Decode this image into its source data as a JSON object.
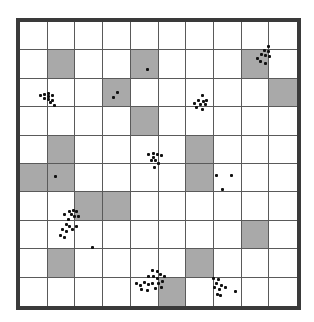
{
  "grid": {
    "rows": 10,
    "cols": 10,
    "shaded_color": "#a9a9a9",
    "border_color": "#3a3a3a",
    "line_color": "#5a5a5a",
    "shaded_cells": [
      [
        1,
        1
      ],
      [
        1,
        4
      ],
      [
        1,
        8
      ],
      [
        2,
        3
      ],
      [
        2,
        9
      ],
      [
        3,
        4
      ],
      [
        4,
        1
      ],
      [
        4,
        6
      ],
      [
        5,
        0
      ],
      [
        5,
        1
      ],
      [
        5,
        6
      ],
      [
        6,
        2
      ],
      [
        6,
        3
      ],
      [
        7,
        8
      ],
      [
        8,
        1
      ],
      [
        8,
        6
      ],
      [
        9,
        5
      ]
    ]
  },
  "dot_clusters": [
    {
      "name": "cluster-top-right",
      "points": [
        [
          268,
          46
        ],
        [
          264,
          50
        ],
        [
          268,
          51
        ],
        [
          261,
          54
        ],
        [
          265,
          55
        ],
        [
          269,
          56
        ],
        [
          257,
          58
        ],
        [
          260,
          61
        ],
        [
          265,
          63
        ]
      ]
    },
    {
      "name": "cluster-left-row2",
      "points": [
        [
          40,
          95
        ],
        [
          44,
          94
        ],
        [
          48,
          93
        ],
        [
          48,
          96
        ],
        [
          52,
          95
        ],
        [
          44,
          98
        ],
        [
          48,
          99
        ],
        [
          52,
          100
        ],
        [
          50,
          102
        ],
        [
          54,
          105
        ]
      ]
    },
    {
      "name": "cluster-row2-shaded",
      "points": [
        [
          117,
          92
        ],
        [
          113,
          97
        ]
      ]
    },
    {
      "name": "single-row1-shaded",
      "points": [
        [
          147,
          69
        ]
      ]
    },
    {
      "name": "cluster-mid-right",
      "points": [
        [
          202,
          95
        ],
        [
          198,
          100
        ],
        [
          203,
          101
        ],
        [
          206,
          100
        ],
        [
          194,
          103
        ],
        [
          200,
          104
        ],
        [
          205,
          104
        ],
        [
          196,
          107
        ],
        [
          202,
          109
        ]
      ]
    },
    {
      "name": "cluster-center",
      "points": [
        [
          148,
          154
        ],
        [
          153,
          153
        ],
        [
          157,
          154
        ],
        [
          153,
          157
        ],
        [
          161,
          155
        ],
        [
          151,
          160
        ],
        [
          155,
          160
        ],
        [
          158,
          163
        ],
        [
          154,
          167
        ]
      ]
    },
    {
      "name": "single-row5-left",
      "points": [
        [
          55,
          176
        ]
      ]
    },
    {
      "name": "scattered-row5-right",
      "points": [
        [
          216,
          175
        ],
        [
          231,
          175
        ],
        [
          222,
          189
        ]
      ]
    },
    {
      "name": "cluster-lower-left",
      "points": [
        [
          69,
          211
        ],
        [
          73,
          210
        ],
        [
          76,
          211
        ],
        [
          64,
          214
        ],
        [
          71,
          214
        ],
        [
          74,
          216
        ],
        [
          68,
          219
        ],
        [
          78,
          216
        ],
        [
          66,
          224
        ],
        [
          69,
          226
        ],
        [
          62,
          229
        ],
        [
          66,
          231
        ],
        [
          72,
          229
        ],
        [
          76,
          226
        ],
        [
          60,
          235
        ],
        [
          64,
          237
        ]
      ]
    },
    {
      "name": "single-lower-left",
      "points": [
        [
          92,
          247
        ]
      ]
    },
    {
      "name": "cluster-bottom-center",
      "points": [
        [
          152,
          270
        ],
        [
          157,
          271
        ],
        [
          160,
          274
        ],
        [
          148,
          276
        ],
        [
          153,
          276
        ],
        [
          157,
          278
        ],
        [
          164,
          276
        ],
        [
          136,
          283
        ],
        [
          140,
          285
        ],
        [
          144,
          282
        ],
        [
          148,
          284
        ],
        [
          152,
          283
        ],
        [
          158,
          283
        ],
        [
          162,
          281
        ],
        [
          141,
          289
        ],
        [
          147,
          290
        ],
        [
          155,
          288
        ],
        [
          161,
          287
        ]
      ]
    },
    {
      "name": "cluster-bottom-right",
      "points": [
        [
          213,
          278
        ],
        [
          218,
          279
        ],
        [
          216,
          283
        ],
        [
          221,
          285
        ],
        [
          214,
          287
        ],
        [
          219,
          289
        ],
        [
          225,
          287
        ],
        [
          217,
          294
        ],
        [
          220,
          295
        ],
        [
          235,
          291
        ]
      ]
    }
  ]
}
